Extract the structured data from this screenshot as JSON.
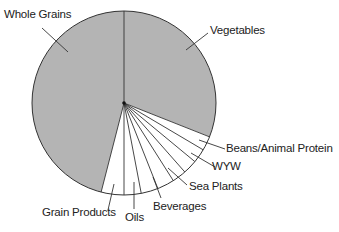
{
  "chart_data": {
    "type": "pie",
    "title": "",
    "start_angle_deg_clockwise_from_top": 0,
    "categories": [
      "Vegetables",
      "Beans/Animal Protein",
      "WYW",
      "Sea Plants",
      "Beverages",
      "Oils",
      "Grain Products",
      "Whole Grains"
    ],
    "values": [
      31,
      5,
      5,
      3,
      3,
      3,
      4,
      46
    ],
    "fills": [
      "#b4b4b4",
      "#ffffff",
      "#ffffff",
      "#ffffff",
      "#ffffff",
      "#ffffff",
      "#ffffff",
      "#b4b4b4"
    ],
    "extra_divider_lines_in_white_region": 2,
    "legend": "none (direct labels with leader lines)",
    "units": "percent (estimated, no numeric labels shown)"
  },
  "labels": {
    "whole_grains": "Whole Grains",
    "vegetables": "Vegetables",
    "beans": "Beans/Animal Protein",
    "wyw": "WYW",
    "sea_plants": "Sea Plants",
    "beverages": "Beverages",
    "oils": "Oils",
    "grain_products": "Grain Products"
  },
  "colors": {
    "shaded": "#b4b4b4",
    "white": "#ffffff",
    "stroke": "#333333",
    "text": "#222222"
  }
}
